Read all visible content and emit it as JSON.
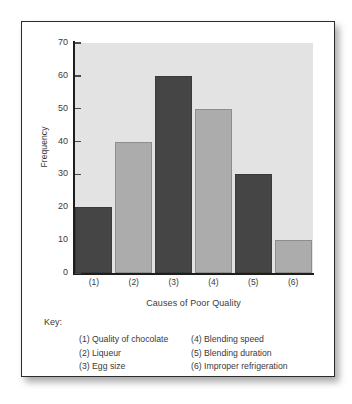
{
  "chart_data": {
    "type": "bar",
    "title": "",
    "xlabel": "Causes of Poor Quality",
    "ylabel": "Frequency",
    "categories": [
      "(1)",
      "(2)",
      "(3)",
      "(4)",
      "(5)",
      "(6)"
    ],
    "values": [
      20,
      40,
      60,
      50,
      30,
      10
    ],
    "bar_colors": [
      "#454545",
      "#acacac",
      "#454545",
      "#acacac",
      "#454545",
      "#acacac"
    ],
    "ylim": [
      0,
      70
    ],
    "ytick_labels": [
      "70",
      "60",
      "50",
      "40",
      "30",
      "20",
      "10",
      "0"
    ],
    "ytick_values": [
      70,
      60,
      50,
      40,
      30,
      20,
      10,
      0
    ],
    "grid": false,
    "legend_position": "below",
    "plot_background": "#e3e3e3",
    "axis_color": "#1d1d1d"
  },
  "key": {
    "title": "Key:",
    "left_column": [
      "(1) Quality of chocolate",
      "(2) Liqueur",
      "(3) Egg size"
    ],
    "right_column": [
      "(4) Blending speed",
      "(5) Blending duration",
      "(6) Improper refrigeration"
    ]
  }
}
